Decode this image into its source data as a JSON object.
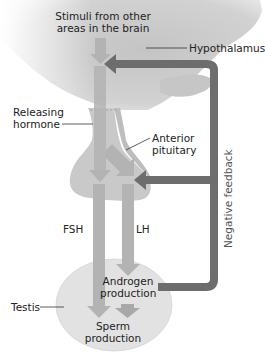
{
  "diagram": {
    "colors": {
      "hypothalamus_fill": "#cfcfcf",
      "pituitary_fill": "#c9c9c9",
      "testis_fill": "#e2e2e2",
      "hormone_arrow": "#b3b3b3",
      "feedback_arrow": "#6d6d6d",
      "text": "#222222"
    },
    "labels": {
      "stimuli_line1": "Stimuli from other",
      "stimuli_line2": "areas in the brain",
      "hypothalamus": "Hypothalamus",
      "releasing_line1": "Releasing",
      "releasing_line2": "hormone",
      "anterior_line1": "Anterior",
      "anterior_line2": "pituitary",
      "negative_feedback": "Negative feedback",
      "fsh": "FSH",
      "lh": "LH",
      "androgen_line1": "Androgen",
      "androgen_line2": "production",
      "testis": "Testis",
      "sperm_line1": "Sperm",
      "sperm_line2": "production"
    },
    "nodes": [
      {
        "id": "hypothalamus",
        "label": "Hypothalamus"
      },
      {
        "id": "anterior-pituitary",
        "label": "Anterior pituitary"
      },
      {
        "id": "testis",
        "label": "Testis"
      },
      {
        "id": "androgen-production",
        "label": "Androgen production"
      },
      {
        "id": "sperm-production",
        "label": "Sperm production"
      }
    ],
    "edges": [
      {
        "from": "stimuli",
        "to": "hypothalamus",
        "label": ""
      },
      {
        "from": "hypothalamus",
        "to": "anterior-pituitary",
        "label": "Releasing hormone"
      },
      {
        "from": "anterior-pituitary",
        "to": "sperm-production",
        "label": "FSH"
      },
      {
        "from": "anterior-pituitary",
        "to": "androgen-production",
        "label": "LH"
      },
      {
        "from": "androgen-production",
        "to": "sperm-production",
        "label": ""
      },
      {
        "from": "androgen-production",
        "to": "hypothalamus",
        "label": "Negative feedback"
      },
      {
        "from": "androgen-production",
        "to": "anterior-pituitary",
        "label": "Negative feedback"
      }
    ]
  }
}
